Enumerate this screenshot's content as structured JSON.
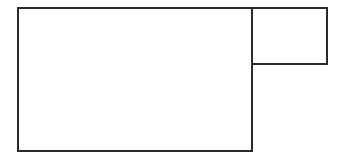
{
  "diagram": {
    "stroke_color": "#2a2a2a",
    "background": "#ffffff",
    "shapes": [
      {
        "name": "large-rectangle",
        "x": 17,
        "y": 7,
        "width": 236,
        "height": 145
      },
      {
        "name": "small-rectangle",
        "x": 251,
        "y": 7,
        "width": 77,
        "height": 58
      }
    ]
  }
}
